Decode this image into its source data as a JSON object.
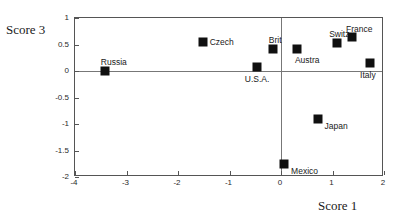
{
  "chart_data": {
    "type": "scatter",
    "title": "",
    "xlabel": "Score 1",
    "ylabel": "Score 3",
    "xlim": [
      -4,
      2
    ],
    "ylim": [
      -2,
      1
    ],
    "grid": false,
    "legend": "none",
    "xticks": [
      "-4",
      "-3",
      "-2",
      "-1",
      "0",
      "1",
      "2"
    ],
    "xtick_values": [
      -4,
      -3,
      -2,
      -1,
      0,
      1,
      2
    ],
    "yticks": [
      "1",
      "0.5",
      "0",
      "-0.5",
      "-1",
      "-1.5",
      "-2"
    ],
    "ytick_values": [
      1,
      0.5,
      0,
      -0.5,
      -1,
      -1.5,
      -2
    ],
    "reference_lines": {
      "x": 0,
      "y": 0
    },
    "points": [
      {
        "label": "Russia",
        "x": -3.42,
        "y": 0.0,
        "label_dx": -4,
        "label_dy": -14
      },
      {
        "label": "Czech",
        "x": -1.52,
        "y": 0.55,
        "label_dx": 7,
        "label_dy": -5
      },
      {
        "label": "Brit",
        "x": -0.16,
        "y": 0.42,
        "label_dx": -4,
        "label_dy": -14
      },
      {
        "label": "U.S.A.",
        "x": -0.47,
        "y": 0.07,
        "label_dx": -12,
        "label_dy": 7
      },
      {
        "label": "Austra",
        "x": 0.31,
        "y": 0.41,
        "label_dx": -2,
        "label_dy": 6
      },
      {
        "label": "Switz",
        "x": 1.09,
        "y": 0.53,
        "label_dx": -8,
        "label_dy": -14
      },
      {
        "label": "France",
        "x": 1.38,
        "y": 0.65,
        "label_dx": -6,
        "label_dy": -13
      },
      {
        "label": "Italy",
        "x": 1.73,
        "y": 0.15,
        "label_dx": -10,
        "label_dy": 7
      },
      {
        "label": "Japan",
        "x": 0.71,
        "y": -0.91,
        "label_dx": 7,
        "label_dy": 2
      },
      {
        "label": "Mexico",
        "x": 0.06,
        "y": -1.76,
        "label_dx": 7,
        "label_dy": 2
      }
    ]
  },
  "colors": {
    "marker": "#101010",
    "frame": "#555555",
    "reference_line": "#777777",
    "background": "#ffffff"
  }
}
